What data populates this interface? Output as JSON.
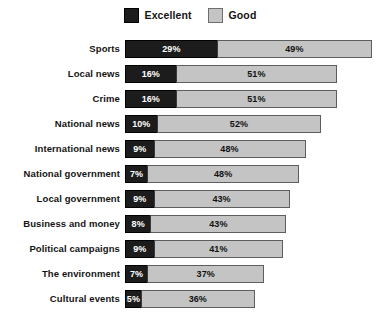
{
  "legend": {
    "entries": [
      {
        "label": "Excellent",
        "color": "#1c1c1c",
        "key": "excellent"
      },
      {
        "label": "Good",
        "color": "#c4c4c4",
        "key": "good"
      }
    ]
  },
  "chart_data": {
    "type": "bar",
    "orientation": "horizontal",
    "stacked": true,
    "title": "",
    "subtitle": "",
    "xlabel": "",
    "ylabel": "",
    "xlim": [
      0,
      78
    ],
    "grid": false,
    "legend_position": "top-center",
    "value_suffix": "%",
    "categories": [
      "Sports",
      "Local news",
      "Crime",
      "National news",
      "International news",
      "National government",
      "Local government",
      "Business and money",
      "Political campaigns",
      "The environment",
      "Cultural events"
    ],
    "series": [
      {
        "name": "Excellent",
        "color": "#1c1c1c",
        "values": [
          29,
          16,
          16,
          10,
          9,
          7,
          9,
          8,
          9,
          7,
          5
        ],
        "labels": [
          "29%",
          "16%",
          "16%",
          "10%",
          "9%",
          "7%",
          "9%",
          "8%",
          "9%",
          "7%",
          "5%"
        ]
      },
      {
        "name": "Good",
        "color": "#c4c4c4",
        "values": [
          49,
          51,
          51,
          52,
          48,
          48,
          43,
          43,
          41,
          37,
          36
        ],
        "labels": [
          "49%",
          "51%",
          "51%",
          "52%",
          "48%",
          "48%",
          "43%",
          "43%",
          "41%",
          "37%",
          "36%"
        ]
      }
    ],
    "totals": [
      78,
      67,
      67,
      62,
      57,
      55,
      52,
      51,
      50,
      44,
      41
    ]
  }
}
